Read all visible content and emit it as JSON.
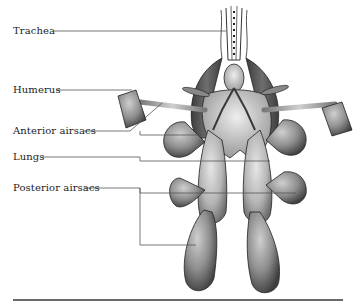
{
  "figure": {
    "labels": [
      {
        "id": "trachea",
        "text": "Trachea"
      },
      {
        "id": "humerus",
        "text": "Humerus"
      },
      {
        "id": "anterior_airsacs",
        "text": "Anterior airsacs"
      },
      {
        "id": "lungs",
        "text": "Lungs"
      },
      {
        "id": "posterior_airsacs",
        "text": "Posterior airsacs"
      }
    ],
    "colors": {
      "leader_line": "#555555",
      "organ_dark": "#4a4a4a",
      "organ_mid": "#8c8c8c",
      "organ_light": "#d8d8d8",
      "outline": "#1f1f1f",
      "rule": "#6a6a6a"
    }
  }
}
